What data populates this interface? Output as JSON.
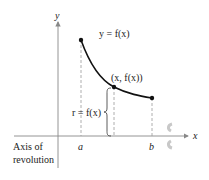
{
  "diagram": {
    "axes": {
      "x_label": "x",
      "y_label": "y"
    },
    "curve_label": "y = f(x)",
    "point_label": "(x, f(x))",
    "radius_label": "r = f(x)",
    "tick_a": "a",
    "tick_b": "b",
    "axis_of_revolution": {
      "line1": "Axis of",
      "line2": "revolution"
    },
    "colors": {
      "curve": "#111111",
      "axis": "#888888",
      "dashed": "#999999",
      "arrow": "#c8c8c8"
    }
  }
}
